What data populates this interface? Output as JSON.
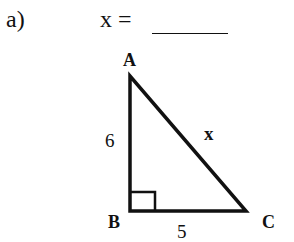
{
  "problem": {
    "label": "a)",
    "equation": "x =",
    "answer_blank": ""
  },
  "triangle": {
    "vertices": {
      "A": "A",
      "B": "B",
      "C": "C"
    },
    "sides": {
      "AB": "6",
      "BC": "5",
      "AC": "x"
    },
    "right_angle_at": "B",
    "stroke_color": "#111111"
  }
}
